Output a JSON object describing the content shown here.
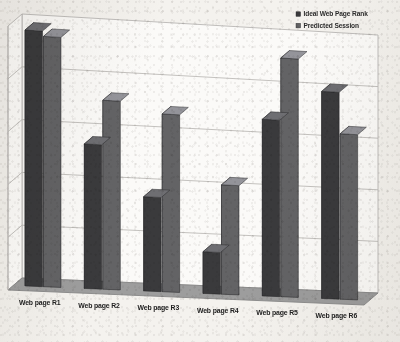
{
  "chart_data": {
    "type": "bar",
    "title": "",
    "subtitle": "",
    "xlabel": "",
    "ylabel": "",
    "grid": true,
    "gridlines": 6,
    "legend_position": "top-right",
    "style": "3d-clustered-column",
    "ylim": [
      0,
      100
    ],
    "axis_labels_visible": false,
    "categories": [
      "Web page R1",
      "Web page R2",
      "Web page R3",
      "Web page R4",
      "Web page R5",
      "Web page R6"
    ],
    "series": [
      {
        "name": "Ideal Web Page Rank",
        "color": "#3a3a3c",
        "values": [
          97,
          55,
          36,
          16,
          68,
          80
        ]
      },
      {
        "name": "Predicted Session",
        "color": "#636365",
        "values": [
          95,
          72,
          68,
          42,
          92,
          64
        ]
      }
    ]
  },
  "legend": {
    "items": [
      {
        "label": "Ideal Web Page Rank",
        "swatch": "legend-swatch-dark"
      },
      {
        "label": "Predicted Session",
        "swatch": "legend-swatch-light"
      }
    ]
  },
  "colors": {
    "series_dark": "#3a3a3c",
    "series_dark_side": "#56565a",
    "series_dark_top": "#6e6e72",
    "series_light": "#636365",
    "series_light_side": "#7c7c80",
    "series_light_top": "#94949a",
    "floor": "#9d9d9d",
    "floor_edge": "#878787",
    "wall": "#fbfaf8",
    "gridline": "#b9b7b4",
    "page_background": "#f4f2ee",
    "text": "#232323"
  }
}
